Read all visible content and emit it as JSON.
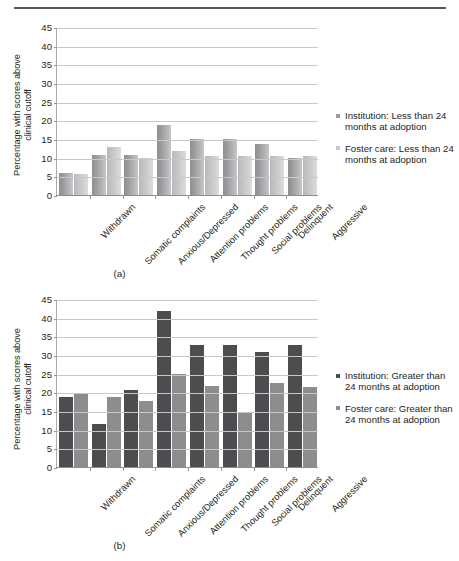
{
  "figures": [
    {
      "id": "a",
      "caption": "(a)",
      "ylabel_line1": "Percentage with scores above",
      "ylabel_line2": "clinical cutoff",
      "legend": [
        "Institution: Less than 24 months at adoption",
        "Foster care: Less than 24 months at adoption"
      ]
    },
    {
      "id": "b",
      "caption": "(b)",
      "ylabel_line1": "Percentage with scores above",
      "ylabel_line2": "clinical cutoff",
      "legend": [
        "Institution: Greater than 24 months at adoption",
        "Foster care: Greater than 24 months at adoption"
      ]
    }
  ],
  "chart_data": [
    {
      "type": "bar",
      "id": "a",
      "title": "(a)",
      "xlabel": "",
      "ylabel": "Percentage with scores above clinical cutoff",
      "ylim": [
        0,
        45
      ],
      "yticks": [
        0,
        5,
        10,
        15,
        20,
        25,
        30,
        35,
        40,
        45
      ],
      "grid": true,
      "legend_position": "right",
      "categories": [
        "Withdrawn",
        "Somatic complaints",
        "Anxious/Depressed",
        "Attention problems",
        "Thought problems",
        "Social problems",
        "Delinquent",
        "Aggressive"
      ],
      "series": [
        {
          "name": "Institution: Less than 24 months at adoption",
          "color": "#9d9d9f",
          "values": [
            5.9,
            10.8,
            10.8,
            18.8,
            14.9,
            14.9,
            13.6,
            9.9
          ]
        },
        {
          "name": "Foster care: Less than 24 months at adoption",
          "color": "#c9c9cb",
          "values": [
            5.7,
            12.8,
            9.9,
            11.7,
            10.5,
            10.5,
            10.5,
            10.5
          ]
        }
      ]
    },
    {
      "type": "bar",
      "id": "b",
      "title": "(b)",
      "xlabel": "",
      "ylabel": "Percentage with scores above clinical cutoff",
      "ylim": [
        0,
        45
      ],
      "yticks": [
        0,
        5,
        10,
        15,
        20,
        25,
        30,
        35,
        40,
        45
      ],
      "grid": true,
      "legend_position": "right",
      "categories": [
        "Withdrawn",
        "Somatic complaints",
        "Anxious/Depressed",
        "Attention problems",
        "Thought problems",
        "Social problems",
        "Delinquent",
        "Aggressive"
      ],
      "series": [
        {
          "name": "Institution: Greater than 24 months at adoption",
          "color": "#4d4d4f",
          "values": [
            18.7,
            11.5,
            20.6,
            41.7,
            32.8,
            32.8,
            30.8,
            32.8
          ]
        },
        {
          "name": "Foster care: Greater than 24 months at adoption",
          "color": "#8d8d8f",
          "values": [
            19.9,
            18.7,
            17.7,
            24.9,
            21.7,
            14.8,
            22.6,
            21.5
          ]
        }
      ]
    }
  ]
}
